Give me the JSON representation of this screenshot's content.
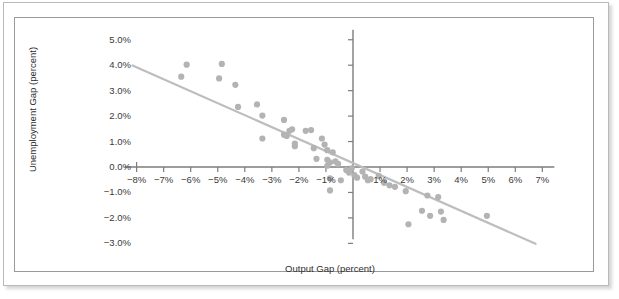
{
  "chart_data": {
    "type": "scatter",
    "title": "",
    "xlabel": "Output Gap (percent)",
    "ylabel": "Unemployment Gap (percent)",
    "xlim": [
      -8.6,
      7.4
    ],
    "ylim": [
      -3.4,
      5.3
    ],
    "xticks": [
      -8,
      -7,
      -6,
      -5,
      -4,
      -3,
      -2,
      -1,
      0,
      1,
      2,
      3,
      4,
      5,
      6,
      7
    ],
    "xticklabels": [
      "−8%",
      "−7%",
      "−6%",
      "−5%",
      "−4%",
      "−3%",
      "−2%",
      "−1%",
      "",
      "1%",
      "2%",
      "3%",
      "4%",
      "5%",
      "6%",
      "7%"
    ],
    "yticks": [
      5,
      4,
      3,
      2,
      1,
      0,
      -1,
      -2,
      -3
    ],
    "yticklabels": [
      "5.0%",
      "4.0%",
      "3.0%",
      "2.0%",
      "1.0%",
      "0.0%",
      "−1.0%",
      "−2.0%",
      "−3.0%"
    ],
    "grid": false,
    "legend": null,
    "marker_color": "#b3b3b3",
    "marker_size": 4.2,
    "axis_color": "#7d7d7d",
    "trendline": {
      "color": "#bdbdbd",
      "width": 2.2,
      "x_start": -8.15,
      "y_start": 3.99,
      "x_end": 6.75,
      "y_end": -3.02,
      "slope": -0.47,
      "intercept": 0.16
    },
    "points": [
      {
        "x": -6.15,
        "y": 4.02
      },
      {
        "x": -6.35,
        "y": 3.55
      },
      {
        "x": -4.85,
        "y": 4.05
      },
      {
        "x": -4.95,
        "y": 3.48
      },
      {
        "x": -4.35,
        "y": 3.23
      },
      {
        "x": -4.25,
        "y": 2.36
      },
      {
        "x": -3.55,
        "y": 2.46
      },
      {
        "x": -3.35,
        "y": 2.02
      },
      {
        "x": -3.35,
        "y": 1.12
      },
      {
        "x": -2.55,
        "y": 1.85
      },
      {
        "x": -2.55,
        "y": 1.27
      },
      {
        "x": -2.45,
        "y": 1.22
      },
      {
        "x": -2.35,
        "y": 1.42
      },
      {
        "x": -2.25,
        "y": 1.48
      },
      {
        "x": -2.15,
        "y": 0.82
      },
      {
        "x": -2.15,
        "y": 0.92
      },
      {
        "x": -1.75,
        "y": 1.42
      },
      {
        "x": -1.55,
        "y": 1.45
      },
      {
        "x": -1.45,
        "y": 0.74
      },
      {
        "x": -1.35,
        "y": 0.32
      },
      {
        "x": -1.15,
        "y": 1.12
      },
      {
        "x": -1.05,
        "y": 0.88
      },
      {
        "x": -0.95,
        "y": 0.66
      },
      {
        "x": -0.95,
        "y": 0.28
      },
      {
        "x": -0.95,
        "y": 0.05
      },
      {
        "x": -0.85,
        "y": 0.18
      },
      {
        "x": -0.85,
        "y": -0.45
      },
      {
        "x": -0.85,
        "y": -0.92
      },
      {
        "x": -0.75,
        "y": 0.58
      },
      {
        "x": -0.65,
        "y": 0.22
      },
      {
        "x": -0.55,
        "y": 0.12
      },
      {
        "x": -0.45,
        "y": -0.52
      },
      {
        "x": -0.25,
        "y": -0.12
      },
      {
        "x": -0.15,
        "y": -0.22
      },
      {
        "x": -0.05,
        "y": -0.05
      },
      {
        "x": 0.05,
        "y": -0.32
      },
      {
        "x": 0.15,
        "y": -0.42
      },
      {
        "x": 0.35,
        "y": -0.18
      },
      {
        "x": 0.45,
        "y": -0.38
      },
      {
        "x": 0.55,
        "y": -0.52
      },
      {
        "x": 0.65,
        "y": -0.48
      },
      {
        "x": 0.95,
        "y": -0.35
      },
      {
        "x": 1.15,
        "y": -0.62
      },
      {
        "x": 1.35,
        "y": -0.72
      },
      {
        "x": 1.55,
        "y": -0.78
      },
      {
        "x": 1.95,
        "y": -0.95
      },
      {
        "x": 2.05,
        "y": -2.25
      },
      {
        "x": 2.55,
        "y": -1.72
      },
      {
        "x": 2.75,
        "y": -1.12
      },
      {
        "x": 2.85,
        "y": -1.92
      },
      {
        "x": 3.15,
        "y": -1.18
      },
      {
        "x": 3.25,
        "y": -1.75
      },
      {
        "x": 3.35,
        "y": -2.08
      },
      {
        "x": 4.95,
        "y": -1.92
      }
    ]
  }
}
